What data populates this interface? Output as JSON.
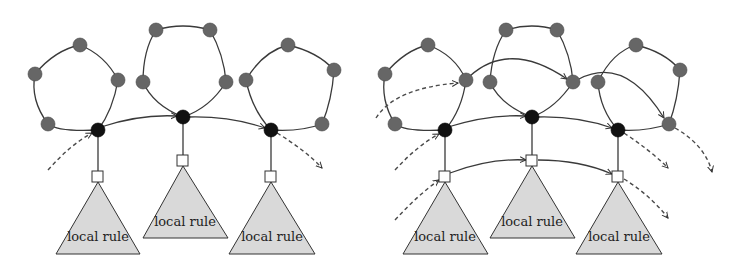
{
  "figure": {
    "panels": [
      {
        "id": "left",
        "description": "Three pentagon cycles linked at their black nodes; each black node attached to a local rule tree",
        "triangle_labels": [
          "local rule",
          "local rule",
          "local rule"
        ]
      },
      {
        "id": "right",
        "description": "Three pentagon cycles with additional cross-links between gray nodes, black nodes, and local-rule roots",
        "triangle_labels": [
          "local rule",
          "local rule",
          "local rule"
        ]
      }
    ],
    "colors": {
      "gray_node": "#666666",
      "black_node": "#111111",
      "triangle_fill": "#d9d9d9",
      "edge": "#3a3a3a"
    }
  }
}
